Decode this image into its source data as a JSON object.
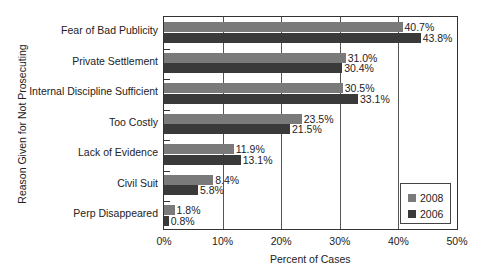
{
  "chart_data": {
    "type": "bar",
    "orientation": "horizontal",
    "title": "",
    "xlabel": "Percent of Cases",
    "ylabel": "Reason Given for Not Prosecuting",
    "xlim": [
      0,
      50
    ],
    "x_ticks": [
      "0%",
      "10%",
      "20%",
      "30%",
      "40%",
      "50%"
    ],
    "grid": "vertical",
    "legend_position": "lower right",
    "categories": [
      "Fear of Bad Publicity",
      "Private Settlement",
      "Internal Discipline Sufficient",
      "Too Costly",
      "Lack of Evidence",
      "Civil Suit",
      "Perp Disappeared"
    ],
    "series": [
      {
        "name": "2008",
        "color": "#7a7a7a",
        "values": [
          40.7,
          31.0,
          30.5,
          23.5,
          11.9,
          8.4,
          1.8
        ],
        "labels": [
          "40.7%",
          "31.0%",
          "30.5%",
          "23.5%",
          "11.9%",
          "8.4%",
          "1.8%"
        ]
      },
      {
        "name": "2006",
        "color": "#3a3a3a",
        "values": [
          43.8,
          30.4,
          33.1,
          21.5,
          13.1,
          5.8,
          0.8
        ],
        "labels": [
          "43.8%",
          "30.4%",
          "33.1%",
          "21.5%",
          "13.1%",
          "5.8%",
          "0.8%"
        ]
      }
    ]
  }
}
